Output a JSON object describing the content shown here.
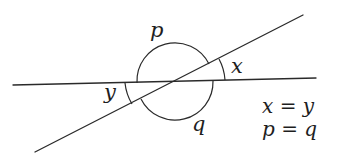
{
  "diagram": {
    "type": "intersecting-lines-angles",
    "lines": [
      {
        "name": "horizontal-line",
        "from": [
          13,
          85
        ],
        "to": [
          316,
          78
        ]
      },
      {
        "name": "diagonal-line",
        "from": [
          35,
          152
        ],
        "to": [
          303,
          15
        ]
      }
    ],
    "intersection": [
      175,
      82
    ],
    "angle_labels": {
      "p": "p",
      "q": "q",
      "x": "x",
      "y": "y"
    },
    "equations": [
      "x = y",
      "p = q"
    ],
    "colors": {
      "stroke": "#2a2a2a",
      "text": "#1e1e1e",
      "background": "#ffffff"
    }
  }
}
